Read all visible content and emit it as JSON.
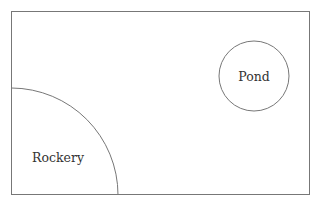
{
  "diagram": {
    "type": "garden plan",
    "boundary": {
      "x": 11,
      "y": 11,
      "width": 299,
      "height": 184,
      "stroke": "#777777"
    },
    "features": [
      {
        "name": "Pond",
        "shape": "circle",
        "cx": 254,
        "cy": 76,
        "r": 35
      },
      {
        "name": "Rockery",
        "shape": "quarter-circle",
        "cx": 11,
        "cy": 195,
        "r": 107
      }
    ]
  },
  "labels": {
    "pond": "Pond",
    "rockery": "Rockery"
  }
}
